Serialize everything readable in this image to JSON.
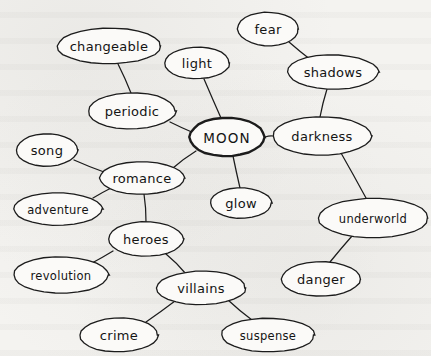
{
  "diagram": {
    "type": "mind-map",
    "style": {
      "background_color": "#f4f3f0",
      "node_fill": "#fbfaf8",
      "stroke_color": "#1c1c1c",
      "central_stroke_color": "#111111"
    },
    "central_node": "MOON",
    "nodes": [
      {
        "id": "moon",
        "label": "MOON",
        "cx": 227,
        "cy": 137,
        "rx": 38,
        "ry": 19,
        "central": true,
        "size": "central"
      },
      {
        "id": "changeable",
        "label": "changeable",
        "cx": 109,
        "cy": 46,
        "rx": 51,
        "ry": 18,
        "central": false,
        "size": "normal"
      },
      {
        "id": "light",
        "label": "light",
        "cx": 197,
        "cy": 63,
        "rx": 32,
        "ry": 16,
        "central": false,
        "size": "normal"
      },
      {
        "id": "fear",
        "label": "fear",
        "cx": 268,
        "cy": 29,
        "rx": 30,
        "ry": 17,
        "central": false,
        "size": "normal"
      },
      {
        "id": "shadows",
        "label": "shadows",
        "cx": 333,
        "cy": 72,
        "rx": 46,
        "ry": 17,
        "central": false,
        "size": "normal"
      },
      {
        "id": "periodic",
        "label": "periodic",
        "cx": 132,
        "cy": 111,
        "rx": 44,
        "ry": 18,
        "central": false,
        "size": "normal"
      },
      {
        "id": "darkness",
        "label": "darkness",
        "cx": 322,
        "cy": 136,
        "rx": 50,
        "ry": 19,
        "central": false,
        "size": "normal"
      },
      {
        "id": "song",
        "label": "song",
        "cx": 47,
        "cy": 150,
        "rx": 31,
        "ry": 16,
        "central": false,
        "size": "normal"
      },
      {
        "id": "romance",
        "label": "romance",
        "cx": 142,
        "cy": 178,
        "rx": 43,
        "ry": 16,
        "central": false,
        "size": "normal"
      },
      {
        "id": "glow",
        "label": "glow",
        "cx": 241,
        "cy": 203,
        "rx": 31,
        "ry": 15,
        "central": false,
        "size": "normal"
      },
      {
        "id": "adventure",
        "label": "adventure",
        "cx": 58,
        "cy": 209,
        "rx": 45,
        "ry": 16,
        "central": false,
        "size": "small"
      },
      {
        "id": "underworld",
        "label": "underworld",
        "cx": 373,
        "cy": 218,
        "rx": 54,
        "ry": 20,
        "central": false,
        "size": "small"
      },
      {
        "id": "heroes",
        "label": "heroes",
        "cx": 146,
        "cy": 239,
        "rx": 38,
        "ry": 17,
        "central": false,
        "size": "normal"
      },
      {
        "id": "revolution",
        "label": "revolution",
        "cx": 61,
        "cy": 275,
        "rx": 48,
        "ry": 18,
        "central": false,
        "size": "small"
      },
      {
        "id": "villains",
        "label": "villains",
        "cx": 201,
        "cy": 288,
        "rx": 44,
        "ry": 17,
        "central": false,
        "size": "normal"
      },
      {
        "id": "danger",
        "label": "danger",
        "cx": 321,
        "cy": 279,
        "rx": 40,
        "ry": 17,
        "central": false,
        "size": "normal"
      },
      {
        "id": "crime",
        "label": "crime",
        "cx": 119,
        "cy": 335,
        "rx": 39,
        "ry": 17,
        "central": false,
        "size": "normal"
      },
      {
        "id": "suspense",
        "label": "suspense",
        "cx": 268,
        "cy": 335,
        "rx": 46,
        "ry": 17,
        "central": false,
        "size": "small"
      }
    ],
    "edges": [
      {
        "from": "changeable",
        "to": "periodic",
        "x1": 118,
        "y1": 64,
        "x2": 131,
        "y2": 93
      },
      {
        "from": "periodic",
        "to": "moon",
        "x1": 170,
        "y1": 122,
        "x2": 194,
        "y2": 133
      },
      {
        "from": "light",
        "to": "moon",
        "x1": 204,
        "y1": 79,
        "x2": 221,
        "y2": 118
      },
      {
        "from": "fear",
        "to": "shadows",
        "x1": 289,
        "y1": 42,
        "x2": 311,
        "y2": 60
      },
      {
        "from": "shadows",
        "to": "darkness",
        "x1": 327,
        "y1": 89,
        "x2": 320,
        "y2": 117
      },
      {
        "from": "moon",
        "to": "darkness",
        "x1": 265,
        "y1": 137,
        "x2": 273,
        "y2": 136
      },
      {
        "from": "darkness",
        "to": "underworld",
        "x1": 341,
        "y1": 153,
        "x2": 366,
        "y2": 198
      },
      {
        "from": "underworld",
        "to": "danger",
        "x1": 352,
        "y1": 236,
        "x2": 330,
        "y2": 262
      },
      {
        "from": "moon",
        "to": "glow",
        "x1": 233,
        "y1": 156,
        "x2": 240,
        "y2": 188
      },
      {
        "from": "moon",
        "to": "romance",
        "x1": 196,
        "y1": 151,
        "x2": 173,
        "y2": 168
      },
      {
        "from": "song",
        "to": "romance",
        "x1": 74,
        "y1": 160,
        "x2": 104,
        "y2": 172
      },
      {
        "from": "adventure",
        "to": "romance",
        "x1": 93,
        "y1": 198,
        "x2": 113,
        "y2": 187
      },
      {
        "from": "romance",
        "to": "heroes",
        "x1": 144,
        "y1": 194,
        "x2": 146,
        "y2": 222
      },
      {
        "from": "heroes",
        "to": "revolution",
        "x1": 113,
        "y1": 251,
        "x2": 92,
        "y2": 263
      },
      {
        "from": "heroes",
        "to": "villains",
        "x1": 166,
        "y1": 254,
        "x2": 186,
        "y2": 274
      },
      {
        "from": "villains",
        "to": "crime",
        "x1": 175,
        "y1": 301,
        "x2": 146,
        "y2": 322
      },
      {
        "from": "villains",
        "to": "suspense",
        "x1": 228,
        "y1": 300,
        "x2": 252,
        "y2": 320
      }
    ]
  }
}
